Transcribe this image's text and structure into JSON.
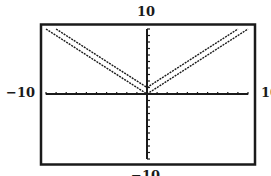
{
  "chart_data": {
    "type": "line",
    "title": "",
    "xlabel": "",
    "ylabel": "",
    "xlim": [
      -10,
      10
    ],
    "ylim": [
      -10,
      10
    ],
    "xscale": 1,
    "yscale": 1,
    "grid": false,
    "window_labels": {
      "ymax": "10",
      "ymin": "−10",
      "xmin": "−10",
      "xmax": "10"
    },
    "series": [
      {
        "name": "y = |x|",
        "x": [
          -10,
          0,
          10
        ],
        "y": [
          10,
          0,
          10
        ]
      },
      {
        "name": "y = |x| + 1",
        "x": [
          -9,
          0,
          9
        ],
        "y": [
          10,
          1,
          10
        ]
      }
    ]
  }
}
